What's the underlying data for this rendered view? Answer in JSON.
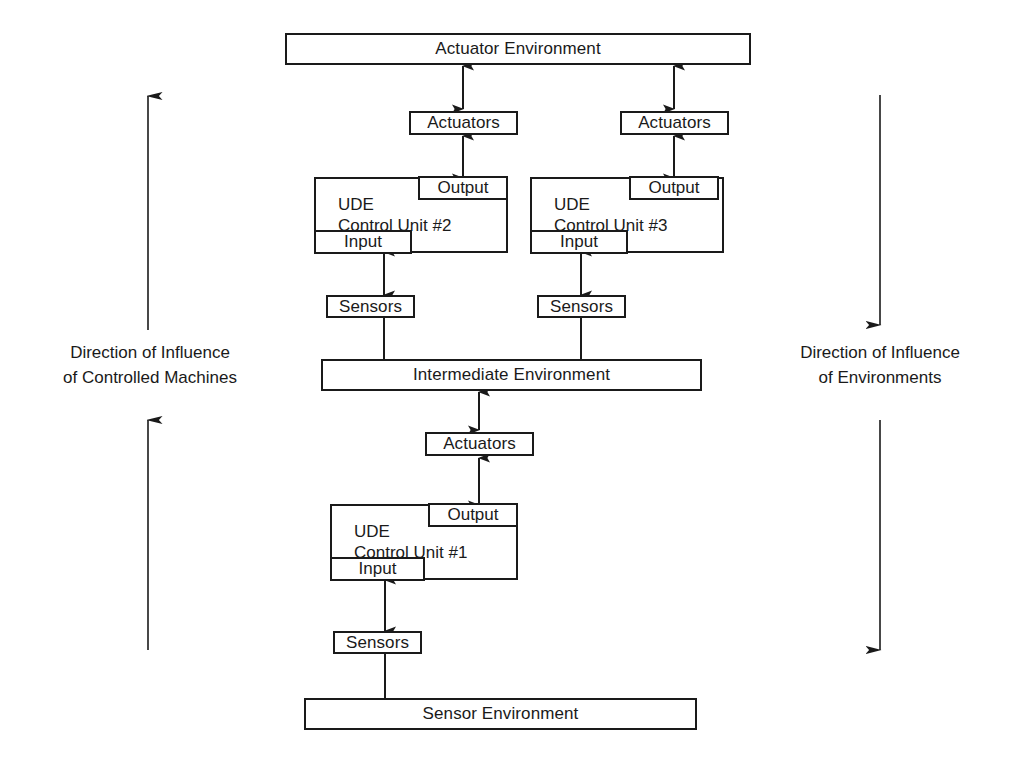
{
  "diagram": {
    "stroke_color": "#1a1a1a",
    "background_color": "#ffffff"
  },
  "environments": {
    "actuator": "Actuator Environment",
    "intermediate": "Intermediate Environment",
    "sensor": "Sensor Environment"
  },
  "control_units": [
    {
      "id": "unit1",
      "line1": "UDE",
      "line2": "Control Unit #1",
      "output_label": "Output",
      "input_label": "Input"
    },
    {
      "id": "unit2",
      "line1": "UDE",
      "line2": "Control Unit #2",
      "output_label": "Output",
      "input_label": "Input"
    },
    {
      "id": "unit3",
      "line1": "UDE",
      "line2": "Control Unit #3",
      "output_label": "Output",
      "input_label": "Input"
    }
  ],
  "interface_blocks": {
    "actuators_top_left": "Actuators",
    "actuators_top_right": "Actuators",
    "actuators_middle": "Actuators",
    "sensors_left": "Sensors",
    "sensors_right": "Sensors",
    "sensors_bottom": "Sensors"
  },
  "annotations": {
    "left": {
      "line1": "Direction of Influence",
      "line2": "of Controlled Machines",
      "arrow_direction": "up"
    },
    "right": {
      "line1": "Direction of Influence",
      "line2": "of Environments",
      "arrow_direction": "down"
    }
  }
}
